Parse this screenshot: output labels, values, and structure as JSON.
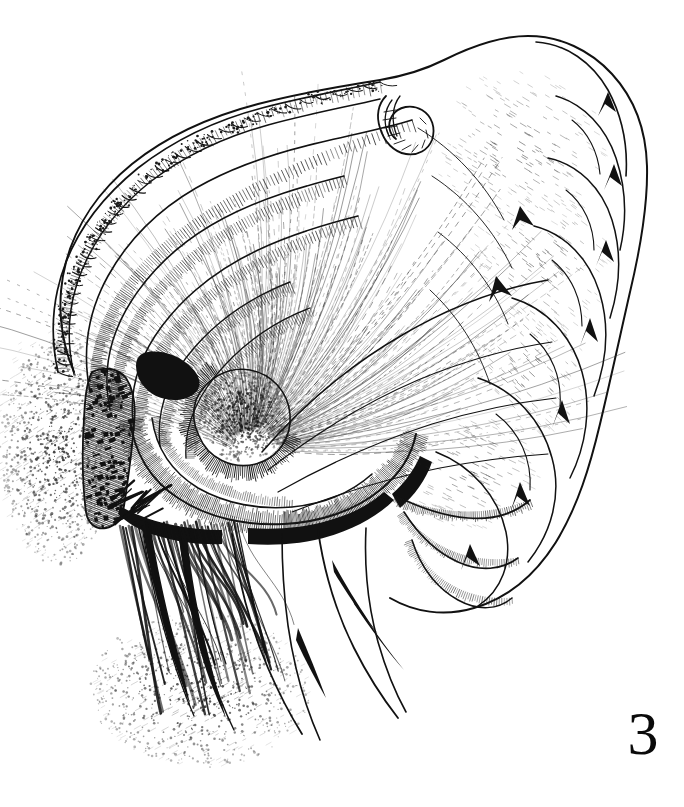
{
  "figure": {
    "number_label": "3",
    "caption": "",
    "background_color": "#ffffff",
    "ink_color": "#111111",
    "medium": "pen-and-ink line drawing",
    "orientation": "lateral view",
    "canvas": {
      "width": 684,
      "height": 807
    },
    "drawing_bounds": {
      "x": 18,
      "y": 34,
      "width": 630,
      "height": 690
    }
  },
  "parts": {
    "upper_scalloped_margin": "scalloped ridged dorsal margin, upper left",
    "nested_ridges": "series of nested curved ridges with fine hatching",
    "annulated_hook": "small annulated tube-like hook at top center",
    "central_fan": "radiating stippled fan converging to a focal point",
    "stippled_papilla": "dense stippled oval papilla at center left",
    "reticulate_patch": "cross-hatched reticulate patch on left flank",
    "lobed_lappets": "series of rounded lobes along the right margin",
    "spines": "four elongate tapering spines at lower left",
    "shadow_stipple": "graded stipple shading outside left and lower margin"
  }
}
